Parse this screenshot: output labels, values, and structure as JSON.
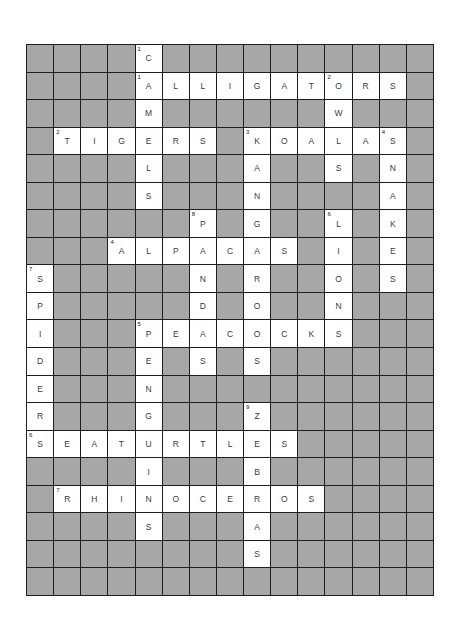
{
  "puzzle": {
    "rows": 20,
    "cols": 15,
    "colors": {
      "blocked": "#a7a7a7",
      "open": "#ffffff",
      "border": "#1e1e1e",
      "letter": "#3a3a3a"
    },
    "across": [
      {
        "number": "1",
        "answer": "ALLIGATORS",
        "row": 1,
        "col": 4
      },
      {
        "number": "2",
        "answer": "TIGERS",
        "row": 3,
        "col": 1
      },
      {
        "number": "3",
        "answer": "KOALAS",
        "row": 3,
        "col": 8
      },
      {
        "number": "4",
        "answer": "ALPACAS",
        "row": 7,
        "col": 3
      },
      {
        "number": "5",
        "answer": "PEACOCKS",
        "row": 10,
        "col": 4
      },
      {
        "number": "6",
        "answer": "SEATURTLES",
        "row": 14,
        "col": 0
      },
      {
        "number": "7",
        "answer": "RHINOCEROS",
        "row": 16,
        "col": 1
      }
    ],
    "down": [
      {
        "number": "1",
        "answer": "CAMELS",
        "row": 0,
        "col": 4
      },
      {
        "number": "2",
        "answer": "OWLS",
        "row": 1,
        "col": 11
      },
      {
        "number": "3",
        "answer": "KANGAROOS",
        "row": 3,
        "col": 8
      },
      {
        "number": "4",
        "answer": "SNAKES",
        "row": 3,
        "col": 13
      },
      {
        "number": "5",
        "answer": "PENGUINS",
        "row": 10,
        "col": 4
      },
      {
        "number": "6",
        "answer": "LIONS",
        "row": 6,
        "col": 11
      },
      {
        "number": "7",
        "answer": "SPIDERS",
        "row": 8,
        "col": 0
      },
      {
        "number": "8",
        "answer": "PANDAS",
        "row": 6,
        "col": 6
      },
      {
        "number": "9",
        "answer": "ZEBRAS",
        "row": 13,
        "col": 8
      }
    ]
  }
}
